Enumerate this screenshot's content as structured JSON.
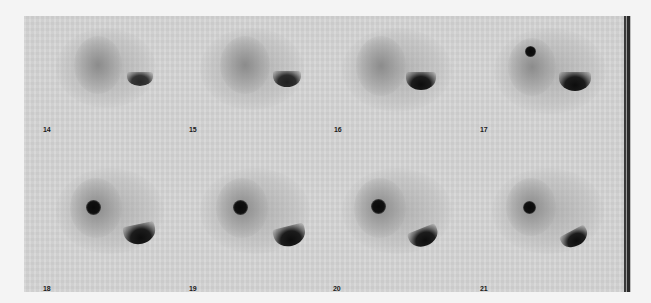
{
  "viewer": {
    "description": "Dynamic scintigraphy frame sequence",
    "background_color": "#d5d5d5",
    "frames": [
      {
        "label": "14",
        "row": 0,
        "col": 0,
        "hotspot": false,
        "crescent_intensity": "medium"
      },
      {
        "label": "15",
        "row": 0,
        "col": 1,
        "hotspot": false,
        "crescent_intensity": "medium"
      },
      {
        "label": "16",
        "row": 0,
        "col": 2,
        "hotspot": false,
        "crescent_intensity": "high"
      },
      {
        "label": "17",
        "row": 0,
        "col": 3,
        "hotspot": true,
        "hotspot_size": "small",
        "crescent_intensity": "high"
      },
      {
        "label": "18",
        "row": 1,
        "col": 0,
        "hotspot": true,
        "hotspot_size": "large",
        "crescent_intensity": "high"
      },
      {
        "label": "19",
        "row": 1,
        "col": 1,
        "hotspot": true,
        "hotspot_size": "large",
        "crescent_intensity": "high"
      },
      {
        "label": "20",
        "row": 1,
        "col": 2,
        "hotspot": true,
        "hotspot_size": "large",
        "crescent_intensity": "high"
      },
      {
        "label": "21",
        "row": 1,
        "col": 3,
        "hotspot": true,
        "hotspot_size": "medium",
        "crescent_intensity": "high"
      }
    ]
  }
}
